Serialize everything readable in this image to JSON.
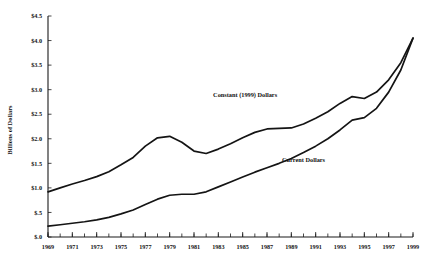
{
  "chart_data": {
    "type": "line",
    "title": "",
    "xlabel": "",
    "ylabel": "Billions of Dollars",
    "xlim": [
      1969,
      1999
    ],
    "ylim": [
      0.0,
      4.5
    ],
    "grid": false,
    "legend_position": "inline-annotation",
    "x": [
      1969,
      1970,
      1971,
      1972,
      1973,
      1974,
      1975,
      1976,
      1977,
      1978,
      1979,
      1980,
      1981,
      1982,
      1983,
      1984,
      1985,
      1986,
      1987,
      1988,
      1989,
      1990,
      1991,
      1992,
      1993,
      1994,
      1995,
      1996,
      1997,
      1998,
      1999
    ],
    "xtick_labels": [
      "1969",
      "1971",
      "1973",
      "1975",
      "1977",
      "1979",
      "1981",
      "1983",
      "1985",
      "1987",
      "1989",
      "1991",
      "1993",
      "1995",
      "1997",
      "1999"
    ],
    "xtick_values": [
      1969,
      1971,
      1973,
      1975,
      1977,
      1979,
      1981,
      1983,
      1985,
      1987,
      1989,
      1991,
      1993,
      1995,
      1997,
      1999
    ],
    "ytick_labels": [
      "$.0",
      "$.5",
      "$1.0",
      "$1.5",
      "$2.0",
      "$2.5",
      "$3.0",
      "$3.5",
      "$4.0",
      "$4.5"
    ],
    "ytick_values": [
      0.0,
      0.5,
      1.0,
      1.5,
      2.0,
      2.5,
      3.0,
      3.5,
      4.0,
      4.5
    ],
    "series": [
      {
        "name": "Constant (1999) Dollars",
        "label_x": 1985.2,
        "label_y": 2.86,
        "values": [
          0.92,
          1.0,
          1.08,
          1.15,
          1.23,
          1.33,
          1.47,
          1.62,
          1.85,
          2.02,
          2.05,
          1.93,
          1.75,
          1.7,
          1.79,
          1.9,
          2.02,
          2.13,
          2.2,
          2.21,
          2.22,
          2.3,
          2.42,
          2.55,
          2.72,
          2.86,
          2.82,
          2.95,
          3.2,
          3.55,
          4.05
        ]
      },
      {
        "name": "Current Dollars",
        "label_x": 1990.0,
        "label_y": 1.52,
        "values": [
          0.22,
          0.25,
          0.28,
          0.31,
          0.35,
          0.4,
          0.47,
          0.55,
          0.66,
          0.77,
          0.85,
          0.87,
          0.87,
          0.92,
          1.02,
          1.12,
          1.22,
          1.32,
          1.41,
          1.5,
          1.6,
          1.72,
          1.85,
          2.0,
          2.18,
          2.38,
          2.43,
          2.62,
          2.95,
          3.4,
          4.05
        ]
      }
    ]
  },
  "geometry": {
    "plot_left": 48,
    "plot_right": 413,
    "plot_top": 16,
    "plot_bottom": 237
  }
}
